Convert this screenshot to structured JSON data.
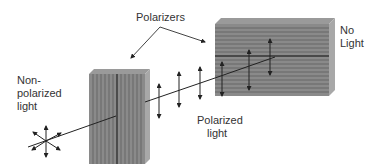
{
  "labels": {
    "polarizers": "Polarizers",
    "non_polarized_line1": "Non-",
    "non_polarized_line2": "polarized",
    "non_polarized_line3": "light",
    "polarized_line1": "Polarized",
    "polarized_line2": "light",
    "no_light_line1": "No",
    "no_light_line2": "Light"
  },
  "colors": {
    "polarizer_face": "#8a8a8a",
    "polarizer_side": "#a8a8a8",
    "polarizer_top": "#9a9a9a",
    "stripe": "#5a5a5a",
    "line": "#222222",
    "text": "#333333"
  },
  "elements": {
    "first_polarizer": {
      "orientation": "vertical"
    },
    "second_polarizer": {
      "orientation": "horizontal"
    }
  }
}
